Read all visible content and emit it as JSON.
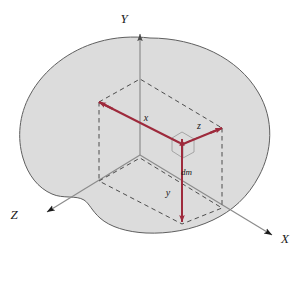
{
  "figure": {
    "title": ""
  },
  "colors": {
    "body_fill": "#dcdcdc",
    "body_stroke": "#606060",
    "axis_stroke": "#8c8c8c",
    "vector_stroke": "#9e2a3c",
    "dashed_stroke": "#3c3c3c",
    "element_stroke": "#9e9e9e",
    "label_color": "#1a1a1a",
    "background": "#ffffff"
  },
  "axes": [
    {
      "key": "y_axis",
      "label": "Y",
      "direction": "up",
      "label_x": 124,
      "label_y": 23
    },
    {
      "key": "z_axis",
      "label": "Z",
      "direction": "down-left",
      "label_x": 14,
      "label_y": 219
    },
    {
      "key": "x_axis",
      "label": "X",
      "direction": "down-right",
      "label_x": 285,
      "label_y": 243
    }
  ],
  "dimensions": [
    {
      "key": "x_dim",
      "label": "x",
      "label_x": 146,
      "label_y": 121
    },
    {
      "key": "z_dim",
      "label": "z",
      "label_x": 199,
      "label_y": 129
    },
    {
      "key": "y_dim",
      "label": "y",
      "label_x": 168,
      "label_y": 196
    }
  ],
  "element": {
    "key": "mass_element",
    "label": "dm",
    "label_x": 181,
    "label_y": 175,
    "center_x": 182,
    "center_y": 144,
    "size": 11
  }
}
